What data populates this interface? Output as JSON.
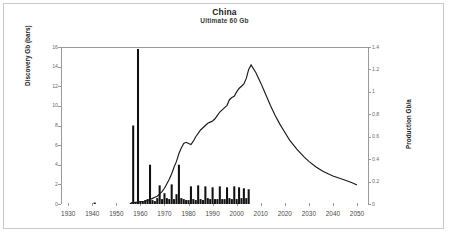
{
  "header": {
    "title": "China",
    "subtitle": "Ultimate  60 Gb"
  },
  "axes": {
    "left_label": "Discovery Gb (bars)",
    "right_label": "Production Gb/a",
    "x_ticks": [
      1930,
      1940,
      1950,
      1960,
      1970,
      1980,
      1990,
      2000,
      2010,
      2020,
      2030,
      2040,
      2050
    ],
    "left_ticks": [
      0,
      2,
      4,
      6,
      8,
      10,
      12,
      14,
      16
    ],
    "right_ticks": [
      "0",
      "0.2",
      "0.4",
      "0.6",
      "0.8",
      "1",
      "1.2",
      "1.4"
    ]
  },
  "chart_data": {
    "type": "bar",
    "title": "China",
    "subtitle": "Ultimate  60 Gb",
    "xlabel": "",
    "ylabel": "Discovery Gb (bars)",
    "y2label": "Production Gb/a",
    "xlim": [
      1927,
      2055
    ],
    "ylim": [
      0,
      16
    ],
    "y2lim": [
      0,
      1.4
    ],
    "grid": false,
    "legend": "none",
    "series": [
      {
        "name": "Discovery Gb (bars)",
        "type": "bar",
        "axis": "left",
        "x": [
          1941,
          1956,
          1957,
          1958,
          1959,
          1960,
          1961,
          1962,
          1963,
          1964,
          1965,
          1966,
          1967,
          1968,
          1969,
          1970,
          1971,
          1972,
          1973,
          1974,
          1975,
          1976,
          1977,
          1978,
          1979,
          1980,
          1981,
          1982,
          1983,
          1984,
          1985,
          1986,
          1987,
          1988,
          1989,
          1990,
          1991,
          1992,
          1993,
          1994,
          1995,
          1996,
          1997,
          1998,
          1999,
          2000,
          2001,
          2002,
          2003,
          2004,
          2005
        ],
        "values": [
          0.15,
          0.1,
          8.0,
          0.2,
          15.8,
          0.3,
          0.2,
          0.4,
          0.5,
          4.0,
          0.4,
          0.3,
          0.6,
          1.9,
          0.5,
          1.1,
          0.6,
          0.5,
          2.0,
          0.5,
          1.0,
          4.0,
          0.6,
          0.5,
          0.4,
          0.4,
          1.8,
          0.5,
          0.4,
          1.9,
          0.5,
          0.4,
          1.8,
          0.6,
          0.5,
          1.7,
          0.5,
          0.5,
          1.8,
          0.5,
          0.5,
          1.7,
          0.6,
          0.5,
          1.8,
          0.5,
          1.7,
          0.6,
          1.6,
          0.6,
          1.5
        ]
      },
      {
        "name": "Production Gb/a",
        "type": "line",
        "axis": "right",
        "x": [
          1956,
          1958,
          1960,
          1962,
          1964,
          1965,
          1966,
          1967,
          1968,
          1969,
          1970,
          1971,
          1972,
          1973,
          1974,
          1975,
          1976,
          1977,
          1978,
          1979,
          1980,
          1981,
          1982,
          1983,
          1984,
          1985,
          1986,
          1987,
          1988,
          1989,
          1990,
          1991,
          1992,
          1993,
          1994,
          1995,
          1996,
          1997,
          1998,
          1999,
          2000,
          2001,
          2002,
          2003,
          2004,
          2005,
          2006,
          2008,
          2010,
          2012,
          2014,
          2016,
          2018,
          2020,
          2022,
          2025,
          2028,
          2030,
          2033,
          2036,
          2040,
          2044,
          2048,
          2050
        ],
        "values": [
          0.01,
          0.015,
          0.02,
          0.025,
          0.04,
          0.05,
          0.06,
          0.07,
          0.09,
          0.11,
          0.14,
          0.18,
          0.22,
          0.27,
          0.33,
          0.38,
          0.45,
          0.5,
          0.54,
          0.55,
          0.54,
          0.53,
          0.56,
          0.6,
          0.63,
          0.66,
          0.68,
          0.7,
          0.72,
          0.73,
          0.74,
          0.76,
          0.79,
          0.82,
          0.84,
          0.86,
          0.88,
          0.93,
          0.95,
          0.96,
          1.0,
          1.03,
          1.05,
          1.07,
          1.12,
          1.2,
          1.24,
          1.17,
          1.08,
          0.98,
          0.88,
          0.79,
          0.71,
          0.64,
          0.57,
          0.49,
          0.42,
          0.38,
          0.33,
          0.29,
          0.25,
          0.22,
          0.19,
          0.17
        ]
      }
    ]
  }
}
